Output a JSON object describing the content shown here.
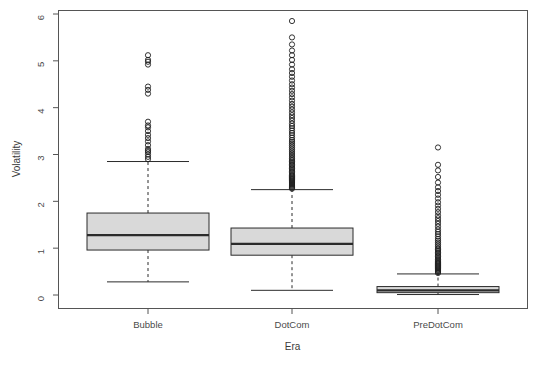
{
  "chart_data": {
    "type": "box",
    "title": "",
    "xlabel": "Era",
    "ylabel": "Volatility",
    "categories": [
      "Bubble",
      "DotCom",
      "PreDotCom"
    ],
    "ylim": [
      0,
      6
    ],
    "yticks": [
      0,
      1,
      2,
      3,
      4,
      5,
      6
    ],
    "ytick_labels": [
      "0",
      "1",
      "2",
      "3",
      "4",
      "5",
      "6"
    ],
    "grid": false,
    "legend": "none",
    "box_fill": "#d9d9d9",
    "box_stroke": "#2b2b2b",
    "axis_color": "#555555",
    "boxes": [
      {
        "category": "Bubble",
        "whisker_low": 0.28,
        "q1": 0.96,
        "median": 1.28,
        "q3": 1.75,
        "whisker_high": 2.85,
        "outliers": [
          2.9,
          2.95,
          3.0,
          3.05,
          3.08,
          3.12,
          3.2,
          3.28,
          3.35,
          3.42,
          3.5,
          3.58,
          3.62,
          3.7,
          4.3,
          4.38,
          4.45,
          4.92,
          4.98,
          5.02,
          5.12
        ]
      },
      {
        "category": "DotCom",
        "whisker_low": 0.1,
        "q1": 0.85,
        "median": 1.09,
        "q3": 1.43,
        "whisker_high": 2.25,
        "outliers": [
          2.27,
          2.29,
          2.31,
          2.33,
          2.35,
          2.37,
          2.39,
          2.41,
          2.43,
          2.45,
          2.47,
          2.49,
          2.51,
          2.53,
          2.55,
          2.58,
          2.61,
          2.64,
          2.67,
          2.7,
          2.73,
          2.76,
          2.79,
          2.82,
          2.85,
          2.88,
          2.91,
          2.95,
          2.99,
          3.03,
          3.07,
          3.11,
          3.15,
          3.19,
          3.23,
          3.27,
          3.31,
          3.36,
          3.41,
          3.46,
          3.51,
          3.56,
          3.61,
          3.66,
          3.72,
          3.78,
          3.84,
          3.9,
          3.96,
          4.02,
          4.08,
          4.15,
          4.22,
          4.29,
          4.36,
          4.43,
          4.5,
          4.58,
          4.66,
          4.74,
          4.82,
          4.92,
          5.02,
          5.12,
          5.22,
          5.35,
          5.5,
          5.85
        ]
      },
      {
        "category": "PreDotCom",
        "whisker_low": 0.01,
        "q1": 0.05,
        "median": 0.1,
        "q3": 0.18,
        "whisker_high": 0.45,
        "outliers": [
          0.47,
          0.49,
          0.51,
          0.53,
          0.55,
          0.57,
          0.59,
          0.61,
          0.63,
          0.65,
          0.67,
          0.69,
          0.71,
          0.73,
          0.76,
          0.79,
          0.82,
          0.85,
          0.88,
          0.91,
          0.94,
          0.97,
          1.0,
          1.04,
          1.08,
          1.12,
          1.16,
          1.2,
          1.25,
          1.3,
          1.35,
          1.4,
          1.46,
          1.52,
          1.58,
          1.64,
          1.7,
          1.77,
          1.84,
          1.91,
          1.98,
          2.06,
          2.14,
          2.22,
          2.3,
          2.4,
          2.52,
          2.66,
          2.78,
          3.15
        ]
      }
    ]
  },
  "layout": {
    "plot_left": 58,
    "plot_right": 527,
    "plot_top": 10,
    "plot_bottom": 308,
    "y_zero_px": 295,
    "y_six_px": 14,
    "centers": [
      148,
      292,
      438
    ],
    "box_half_width": 61,
    "whisker_half_width": 41,
    "canvas_w": 541,
    "canvas_h": 367
  }
}
